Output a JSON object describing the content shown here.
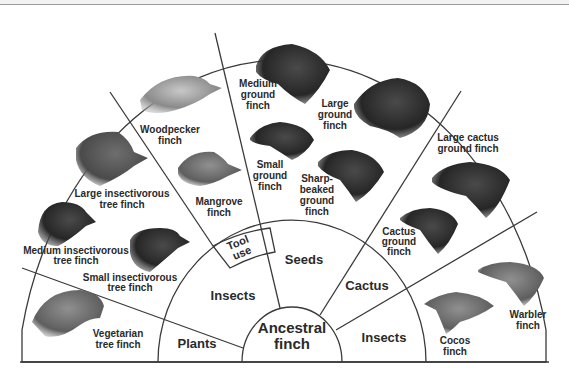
{
  "diagram": {
    "center_label": [
      "Ancestral",
      "finch"
    ],
    "inner_ring": [
      {
        "id": "plants",
        "label": [
          "Plants"
        ]
      },
      {
        "id": "insects-left",
        "label": [
          "Insects"
        ]
      },
      {
        "id": "tool-use",
        "label": [
          "Tool",
          "use"
        ]
      },
      {
        "id": "seeds",
        "label": [
          "Seeds"
        ]
      },
      {
        "id": "cactus",
        "label": [
          "Cactus"
        ]
      },
      {
        "id": "insects-right",
        "label": [
          "Insects"
        ]
      }
    ],
    "finches": [
      {
        "id": "vegetarian-tree-finch",
        "label": [
          "Vegetarian",
          "tree finch"
        ],
        "diet": "Plants"
      },
      {
        "id": "small-insectivorous-tree-finch",
        "label": [
          "Small insectivorous",
          "tree finch"
        ],
        "diet": "Insects"
      },
      {
        "id": "medium-insectivorous-tree-finch",
        "label": [
          "Medium insectivorous",
          "tree finch"
        ],
        "diet": "Insects"
      },
      {
        "id": "large-insectivorous-tree-finch",
        "label": [
          "Large insectivorous",
          "tree finch"
        ],
        "diet": "Insects"
      },
      {
        "id": "woodpecker-finch",
        "label": [
          "Woodpecker",
          "finch"
        ],
        "diet": "Tool use"
      },
      {
        "id": "mangrove-finch",
        "label": [
          "Mangrove",
          "finch"
        ],
        "diet": "Tool use"
      },
      {
        "id": "medium-ground-finch",
        "label": [
          "Medium",
          "ground",
          "finch"
        ],
        "diet": "Seeds"
      },
      {
        "id": "large-ground-finch",
        "label": [
          "Large",
          "ground",
          "finch"
        ],
        "diet": "Seeds"
      },
      {
        "id": "small-ground-finch",
        "label": [
          "Small",
          "ground",
          "finch"
        ],
        "diet": "Seeds"
      },
      {
        "id": "sharp-beaked-ground-finch",
        "label": [
          "Sharp-",
          "beaked",
          "ground",
          "finch"
        ],
        "diet": "Seeds"
      },
      {
        "id": "large-cactus-ground-finch",
        "label": [
          "Large cactus",
          "ground finch"
        ],
        "diet": "Cactus"
      },
      {
        "id": "cactus-ground-finch",
        "label": [
          "Cactus",
          "ground",
          "finch"
        ],
        "diet": "Cactus"
      },
      {
        "id": "warbler-finch",
        "label": [
          "Warbler",
          "finch"
        ],
        "diet": "Insects"
      },
      {
        "id": "cocos-finch",
        "label": [
          "Cocos",
          "finch"
        ],
        "diet": "Insects"
      }
    ],
    "colors": {
      "line": "#3a3a3a",
      "text": "#2a2a2a",
      "bird_dark": "#2b2b2b",
      "bird_mid": "#6a6a6a",
      "bird_light": "#a8a8a8"
    }
  }
}
